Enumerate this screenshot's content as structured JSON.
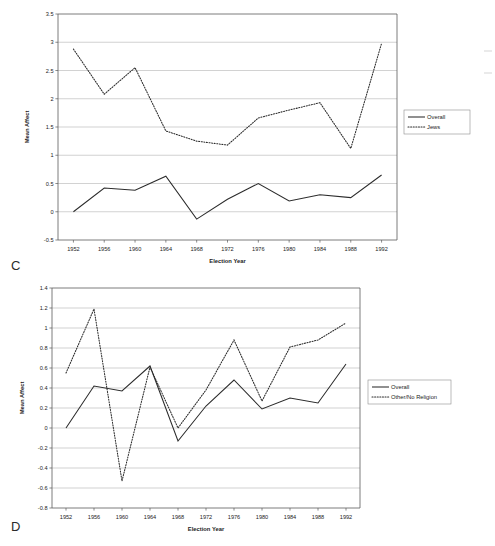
{
  "figure": {
    "panels": [
      {
        "letter": "C",
        "id": "panel-c"
      },
      {
        "letter": "D",
        "id": "panel-d"
      }
    ]
  },
  "chart_data": [
    {
      "type": "line",
      "panel_label": "C",
      "title": "",
      "xlabel": "Election Year",
      "ylabel": "Mean Affect",
      "grid": true,
      "legend_position": "right",
      "x": [
        1952,
        1956,
        1960,
        1964,
        1968,
        1972,
        1976,
        1980,
        1984,
        1988,
        1992
      ],
      "xtick_labels": [
        "1952",
        "1956",
        "1960",
        "1964",
        "1968",
        "1972",
        "1976",
        "1980",
        "1984",
        "1988",
        "1992"
      ],
      "xlim": [
        1950,
        1994
      ],
      "ylim": [
        -0.5,
        3.5
      ],
      "ytick_labels": [
        "-0.5",
        "0",
        "0.5",
        "1",
        "1.5",
        "2",
        "2.5",
        "3",
        "3.5"
      ],
      "ytick_values": [
        -0.5,
        0,
        0.5,
        1,
        1.5,
        2,
        2.5,
        3,
        3.5
      ],
      "series": [
        {
          "name": "Overall",
          "style": "solid",
          "values": [
            0.0,
            0.42,
            0.38,
            0.63,
            -0.13,
            0.22,
            0.5,
            0.19,
            0.3,
            0.25,
            0.65
          ]
        },
        {
          "name": "Jews",
          "style": "dotted",
          "values": [
            2.88,
            2.08,
            2.55,
            1.43,
            1.25,
            1.18,
            1.66,
            1.8,
            1.93,
            1.12,
            2.98
          ]
        }
      ]
    },
    {
      "type": "line",
      "panel_label": "D",
      "title": "",
      "xlabel": "Election Year",
      "ylabel": "Mean Affect",
      "grid": true,
      "legend_position": "right",
      "x": [
        1952,
        1956,
        1960,
        1964,
        1968,
        1972,
        1976,
        1980,
        1984,
        1988,
        1992
      ],
      "xtick_labels": [
        "1952",
        "1956",
        "1960",
        "1964",
        "1968",
        "1972",
        "1976",
        "1980",
        "1984",
        "1988",
        "1992"
      ],
      "xlim": [
        1950,
        1994
      ],
      "ylim": [
        -0.8,
        1.4
      ],
      "ytick_labels": [
        "-0.8",
        "-0.6",
        "-0.4",
        "-0.2",
        "0",
        "0.2",
        "0.4",
        "0.6",
        "0.8",
        "1",
        "1.2",
        "1.4"
      ],
      "ytick_values": [
        -0.8,
        -0.6,
        -0.4,
        -0.2,
        0,
        0.2,
        0.4,
        0.6,
        0.8,
        1.0,
        1.2,
        1.4
      ],
      "series": [
        {
          "name": "Overall",
          "style": "solid",
          "values": [
            0.0,
            0.42,
            0.37,
            0.62,
            -0.13,
            0.22,
            0.48,
            0.19,
            0.3,
            0.25,
            0.64
          ]
        },
        {
          "name": "Other/No Religion",
          "style": "dotted",
          "values": [
            0.55,
            1.19,
            -0.53,
            0.61,
            0.0,
            0.38,
            0.88,
            0.27,
            0.81,
            0.88,
            1.05
          ]
        }
      ]
    }
  ]
}
